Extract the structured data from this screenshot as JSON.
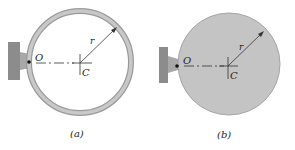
{
  "figures": [
    {
      "id": "a",
      "caption": "(a)",
      "type": "thin ring",
      "labels": {
        "pivot": "O",
        "center": "C",
        "radius": "r"
      }
    },
    {
      "id": "b",
      "caption": "(b)",
      "type": "solid disk",
      "labels": {
        "pivot": "O",
        "center": "C",
        "radius": "r"
      }
    }
  ],
  "colors": {
    "ring_stroke": "#9a9a9a",
    "ring_fill": "#c8c8c8",
    "disk_fill": "#c4c4c4",
    "support": "#8c8c8c",
    "line": "#333333"
  }
}
